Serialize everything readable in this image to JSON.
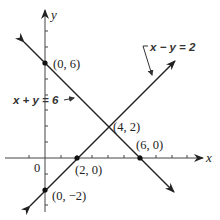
{
  "diagram": {
    "type": "coordinate-graph",
    "axes": {
      "x_label": "x",
      "y_label": "y",
      "origin_label": "0"
    },
    "lines": [
      {
        "id": "line1",
        "equation": "x + y = 6",
        "points": [
          [
            0,
            6
          ],
          [
            6,
            0
          ]
        ]
      },
      {
        "id": "line2",
        "equation": "x − y = 2",
        "points": [
          [
            0,
            -2
          ],
          [
            2,
            0
          ]
        ]
      }
    ],
    "points": [
      {
        "label": "(0, 6)",
        "x": 0,
        "y": 6
      },
      {
        "label": "(4, 2)",
        "x": 4,
        "y": 2
      },
      {
        "label": "(6, 0)",
        "x": 6,
        "y": 0
      },
      {
        "label": "(2, 0)",
        "x": 2,
        "y": 0
      },
      {
        "label": "(0, −2)",
        "x": 0,
        "y": -2
      }
    ],
    "colors": {
      "ink": "#222222",
      "background": "#ffffff"
    }
  }
}
